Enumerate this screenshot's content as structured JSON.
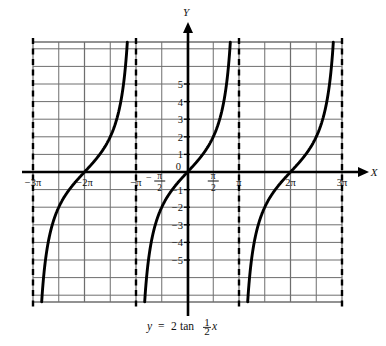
{
  "figure": {
    "caption": "y = 2 tan ½x",
    "caption_parts": {
      "lhs": "y",
      "equals": "=",
      "coefficient": "2",
      "function": "tan",
      "frac_numerator": "1",
      "frac_denominator": "2",
      "variable": "x"
    },
    "axis_labels": {
      "x": "X",
      "y": "Y"
    }
  },
  "chart_data": {
    "type": "line",
    "title": "",
    "subtitle": "",
    "equation": "y = 2 tan (1/2)x",
    "xlabel": "X",
    "ylabel": "Y",
    "xlim": [
      -9.4248,
      9.4248
    ],
    "ylim": [
      -7.9,
      7.9
    ],
    "grid": true,
    "grid_x_step_label": "π/2",
    "grid_y_step": 1,
    "legend": "none",
    "period": "2π",
    "amplitude_coefficient": 2,
    "x_tick_labels": [
      {
        "value": -9.4248,
        "label": "-3π",
        "type": "plain"
      },
      {
        "value": -6.2832,
        "label": "-2π",
        "type": "plain"
      },
      {
        "value": -3.1416,
        "label": "-π",
        "type": "plain"
      },
      {
        "value": -1.5708,
        "label": "-π/2",
        "type": "fraction",
        "sign": "-",
        "num": "π",
        "den": "2"
      },
      {
        "value": 1.5708,
        "label": "π/2",
        "type": "fraction",
        "sign": "",
        "num": "π",
        "den": "2"
      },
      {
        "value": 3.1416,
        "label": "π",
        "type": "plain"
      },
      {
        "value": 6.2832,
        "label": "2π",
        "type": "plain"
      },
      {
        "value": 9.4248,
        "label": "3π",
        "type": "plain"
      }
    ],
    "y_tick_labels": [
      {
        "value": 5,
        "label": "5"
      },
      {
        "value": 4,
        "label": "4"
      },
      {
        "value": 3,
        "label": "3"
      },
      {
        "value": 2,
        "label": "2"
      },
      {
        "value": 1,
        "label": "1"
      },
      {
        "value": 0,
        "label": "0"
      },
      {
        "value": -1,
        "label": "-1"
      },
      {
        "value": -2,
        "label": "-2"
      },
      {
        "value": -3,
        "label": "-3"
      },
      {
        "value": -4,
        "label": "-4"
      },
      {
        "value": -5,
        "label": "-5"
      }
    ],
    "asymptotes": [
      {
        "x": -9.4248,
        "label": "-3π",
        "style": "dashed"
      },
      {
        "x": -3.1416,
        "label": "-π",
        "style": "dashed"
      },
      {
        "x": 3.1416,
        "label": "π",
        "style": "dashed"
      },
      {
        "x": 9.4248,
        "label": "3π",
        "style": "dashed"
      }
    ],
    "branches": [
      {
        "center": -6.2832,
        "domain": [
          -9.4248,
          -3.1416
        ],
        "zero_crossing": -6.2832
      },
      {
        "center": 0,
        "domain": [
          -3.1416,
          3.1416
        ],
        "zero_crossing": 0
      },
      {
        "center": 6.2832,
        "domain": [
          3.1416,
          9.4248
        ],
        "zero_crossing": 6.2832
      }
    ],
    "sample_points": [
      {
        "x": -6.2832,
        "y": 0
      },
      {
        "x": -4.7124,
        "y": 2
      },
      {
        "x": -7.854,
        "y": -2
      },
      {
        "x": 0,
        "y": 0
      },
      {
        "x": 1.5708,
        "y": 2
      },
      {
        "x": -1.5708,
        "y": -2
      },
      {
        "x": 6.2832,
        "y": 0
      },
      {
        "x": 7.854,
        "y": 2
      },
      {
        "x": 4.7124,
        "y": -2
      }
    ]
  },
  "colors": {
    "curve": "#000000",
    "axis": "#000000",
    "grid": "#6e6e6e",
    "asymptote": "#000000",
    "background": "#ffffff"
  }
}
